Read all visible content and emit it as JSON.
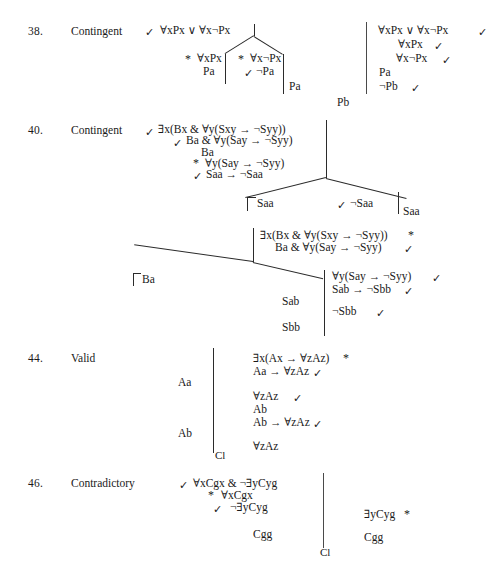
{
  "page": {
    "kind": "logic-truth-tree-answer-key",
    "symbols": {
      "check": "✓",
      "star": "*",
      "forall": "∀",
      "exists": "∃",
      "negation": "¬",
      "disjunction": "∨",
      "conjunction": "&",
      "conditional": "→",
      "closed_branch": "Cl"
    }
  },
  "problems": [
    {
      "number": "38.",
      "verdict": "Contingent",
      "left_tree": {
        "trunk": [
          {
            "mark": "✓",
            "formula": "∀xPx ∨ ∀x¬Px"
          }
        ],
        "branches": [
          {
            "name": "left-branch",
            "lines": [
              {
                "mark": "*",
                "formula": "∀xPx"
              },
              {
                "mark": "",
                "formula": "Pa"
              }
            ]
          },
          {
            "name": "right-branch",
            "lines": [
              {
                "mark": "*",
                "formula": "∀x¬Px"
              },
              {
                "mark": "✓",
                "formula": "¬Pa"
              }
            ]
          }
        ],
        "open_leaves": [
          {
            "label": "Pa"
          },
          {
            "label": "Pb"
          }
        ]
      },
      "right_tree": {
        "lines": [
          {
            "formula": "∀xPx ∨ ∀x¬Px",
            "mark": "✓"
          },
          {
            "formula": "∀xPx",
            "mark": "✓"
          },
          {
            "formula": "∀x¬Px",
            "mark": "✓"
          },
          {
            "formula": "Pa",
            "mark": ""
          },
          {
            "formula": "¬Pb",
            "mark": "✓"
          }
        ]
      }
    },
    {
      "number": "40.",
      "verdict": "Contingent",
      "upper_tree": {
        "trunk": [
          {
            "mark": "✓",
            "formula": "∃x(Bx & ∀y(Sxy → ¬Syy))"
          },
          {
            "mark": "✓",
            "formula": "Ba & ∀y(Say → ¬Syy)"
          },
          {
            "mark": "",
            "formula": "Ba"
          },
          {
            "mark": "*",
            "formula": "∀y(Say → ¬Syy)"
          },
          {
            "mark": "✓",
            "formula": "Saa → ¬Saa"
          }
        ],
        "branches": [
          {
            "name": "left-branch",
            "mark": "",
            "formula": "Saa"
          },
          {
            "name": "right-branch",
            "mark": "✓",
            "formula": "¬Saa"
          }
        ],
        "open_leaf": "Saa"
      },
      "lower_tree": {
        "trunk": [
          {
            "formula": "∃x(Bx & ∀y(Sxy → ¬Syy))",
            "mark": "*"
          },
          {
            "formula": "Ba & ∀y(Say → ¬Syy)",
            "mark": "✓"
          }
        ],
        "left_leaf": "Ba",
        "middle_leaves": [
          "Sab",
          "Sbb"
        ],
        "right_lines": [
          {
            "formula": "∀y(Say → ¬Syy)",
            "mark": "✓"
          },
          {
            "formula": "Sab → ¬Sbb",
            "mark": "✓"
          },
          {
            "formula": "¬Sbb",
            "mark": "✓"
          }
        ]
      }
    },
    {
      "number": "44.",
      "verdict": "Valid",
      "left_column": [
        "Aa",
        "Ab"
      ],
      "closed_marker": "Cl",
      "right_lines": [
        {
          "formula": "∃x(Ax → ∀zAz)",
          "mark": "*"
        },
        {
          "formula": "Aa → ∀zAz",
          "mark": "✓"
        },
        {
          "formula": "∀zAz",
          "mark": "✓"
        },
        {
          "formula": "Ab",
          "mark": ""
        },
        {
          "formula": "Ab → ∀zAz",
          "mark": "✓"
        },
        {
          "formula": "∀zAz",
          "mark": ""
        }
      ]
    },
    {
      "number": "46.",
      "verdict": "Contradictory",
      "left_lines": [
        {
          "mark": "✓",
          "formula": "∀xCgx & ¬∃yCyg"
        },
        {
          "mark": "*",
          "formula": "∀xCgx"
        },
        {
          "mark": "✓",
          "formula": "¬∃yCyg"
        }
      ],
      "left_leaf": "Cgg",
      "closed_marker": "Cl",
      "right_lines": [
        {
          "formula": "∃yCyg",
          "mark": "*"
        },
        {
          "formula": "Cgg",
          "mark": ""
        }
      ]
    }
  ]
}
